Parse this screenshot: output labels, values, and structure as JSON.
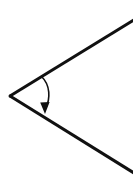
{
  "canvas": {
    "width": 133,
    "height": 180,
    "background_color": "#ffffff"
  },
  "figure": {
    "name": "angle-with-arc-arrow",
    "stroke_color": "#111111",
    "ray_stroke_width": 3,
    "arc_stroke_color": "#111111",
    "arc_stroke_width": 1.6,
    "arrowhead_fill": "#111111",
    "vertex": {
      "x": 10,
      "y": 96
    },
    "rays": [
      {
        "name": "upper-ray",
        "from": {
          "x": 10,
          "y": 96
        },
        "to": {
          "x": 134,
          "y": 20
        }
      },
      {
        "name": "lower-ray",
        "from": {
          "x": 10,
          "y": 96
        },
        "to": {
          "x": 134,
          "y": 173
        }
      }
    ],
    "arc": {
      "name": "angle-sweep-arc",
      "path": "M 41.5 76.5 C 50.5 85 50.5 99 45.5 108.5",
      "direction": "clockwise-downward"
    },
    "arrowhead": {
      "name": "arc-arrowhead",
      "tip": {
        "x": 45,
        "y": 114
      },
      "points": "45,114 40.2,102.5 49.6,102.0",
      "points_label": "downward filled triangle"
    }
  },
  "labels": {
    "has_text_labels": false,
    "items": []
  }
}
